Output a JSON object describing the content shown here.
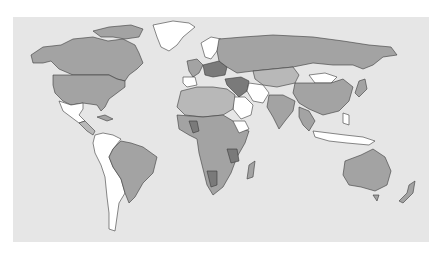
{
  "map": {
    "type": "choropleth world map",
    "projection": "equirectangular-like",
    "background_color": "#e6e6e6",
    "page_color": "#ffffff",
    "legend": null,
    "title": null,
    "shading_classes": [
      {
        "name": "no data",
        "color": "#ffffff"
      },
      {
        "name": "light",
        "color": "#b8b8b8"
      },
      {
        "name": "medium",
        "color": "#a3a3a3"
      },
      {
        "name": "dark",
        "color": "#7a7a7a"
      }
    ],
    "regions": {
      "dark": [
        "Germany",
        "Poland",
        "Czechia",
        "Austria",
        "Hungary",
        "Turkey",
        "Iraq",
        "Syria",
        "Mali",
        "Tanzania",
        "Namibia"
      ],
      "white": [
        "Greenland",
        "Mexico",
        "Iceland",
        "Norway",
        "Spain",
        "Iran",
        "Saudi Arabia",
        "Mongolia",
        "Ethiopia",
        "Colombia",
        "Peru",
        "Bolivia",
        "Argentina",
        "Chile",
        "Paraguay",
        "Uruguay",
        "Venezuela",
        "Guyana",
        "Indonesia",
        "Papua New Guinea",
        "Philippines",
        "Sri Lanka"
      ],
      "medium": [
        "Canada",
        "United States",
        "Russia",
        "China",
        "India",
        "Kazakhstan",
        "Brazil",
        "Australia",
        "most of Africa",
        "Western Europe"
      ]
    }
  }
}
